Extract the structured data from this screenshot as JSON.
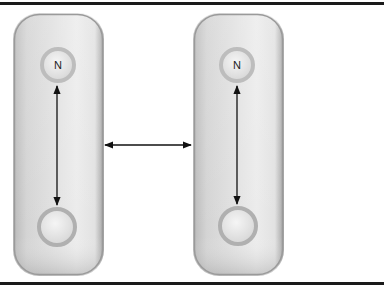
{
  "diagram": {
    "cells": [
      {
        "id": "left-cell",
        "box": {
          "x": 13,
          "y": 13,
          "w": 91,
          "h": 263,
          "r": 26
        },
        "top_circle": {
          "cx": 58,
          "cy": 65,
          "r": 18,
          "label": "N"
        },
        "bottom_circle": {
          "cx": 57,
          "cy": 227,
          "r": 20,
          "label": ""
        },
        "vertical_arrow": {
          "x": 57,
          "y1": 86,
          "y2": 205,
          "type": "double-headed"
        }
      },
      {
        "id": "right-cell",
        "box": {
          "x": 193,
          "y": 13,
          "w": 91,
          "h": 263,
          "r": 26
        },
        "top_circle": {
          "cx": 237,
          "cy": 65,
          "r": 18,
          "label": "N"
        },
        "bottom_circle": {
          "cx": 238,
          "cy": 226,
          "r": 20,
          "label": ""
        },
        "vertical_arrow": {
          "x": 237,
          "y1": 86,
          "y2": 204,
          "type": "double-headed"
        }
      }
    ],
    "horizontal_arrow": {
      "x1": 105,
      "x2": 191,
      "y": 145,
      "type": "double-headed"
    },
    "colors": {
      "cell_fill_light": "#e6e6e6",
      "cell_fill_dark": "#a9a9a9",
      "circle_ring": "#b5b5b5",
      "circle_fill": "#ececec",
      "arrow": "#111111",
      "rule": "#1a1a1a"
    }
  }
}
